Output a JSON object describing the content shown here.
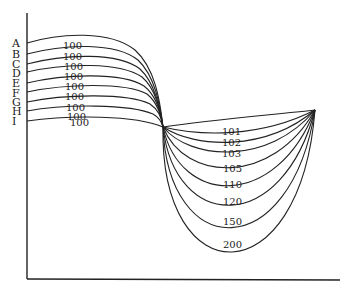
{
  "diagram": {
    "axis_labels": [
      "A",
      "B",
      "C",
      "D",
      "E",
      "F",
      "G",
      "H",
      "I"
    ],
    "upper_curve_labels": [
      "100",
      "100",
      "100",
      "100",
      "100",
      "100",
      "100",
      "100",
      "100"
    ],
    "lower_curve_labels": [
      "101",
      "102",
      "103",
      "105",
      "110",
      "120",
      "150",
      "200"
    ],
    "upper_curves": [
      {
        "label": "A",
        "start_y": 43,
        "peak_y": 36,
        "value": "100"
      },
      {
        "label": "B",
        "start_y": 54,
        "peak_y": 47,
        "value": "100"
      },
      {
        "label": "C",
        "start_y": 64,
        "peak_y": 57,
        "value": "100"
      },
      {
        "label": "D",
        "start_y": 72,
        "peak_y": 66,
        "value": "100"
      },
      {
        "label": "E",
        "start_y": 83,
        "peak_y": 76,
        "value": "100"
      },
      {
        "label": "F",
        "start_y": 92,
        "peak_y": 86,
        "value": "100"
      },
      {
        "label": "G",
        "start_y": 102,
        "peak_y": 96,
        "value": "100"
      },
      {
        "label": "H",
        "start_y": 111,
        "peak_y": 106,
        "value": "100"
      },
      {
        "label": "I",
        "start_y": 121,
        "peak_y": 117,
        "value": "100"
      }
    ],
    "lower_curves": [
      {
        "value": "101",
        "bottom_y": 132
      },
      {
        "value": "102",
        "bottom_y": 144
      },
      {
        "value": "103",
        "bottom_y": 154
      },
      {
        "value": "105",
        "bottom_y": 170
      },
      {
        "value": "110",
        "bottom_y": 188
      },
      {
        "value": "120",
        "bottom_y": 206
      },
      {
        "value": "150",
        "bottom_y": 228
      },
      {
        "value": "200",
        "bottom_y": 252
      }
    ]
  }
}
